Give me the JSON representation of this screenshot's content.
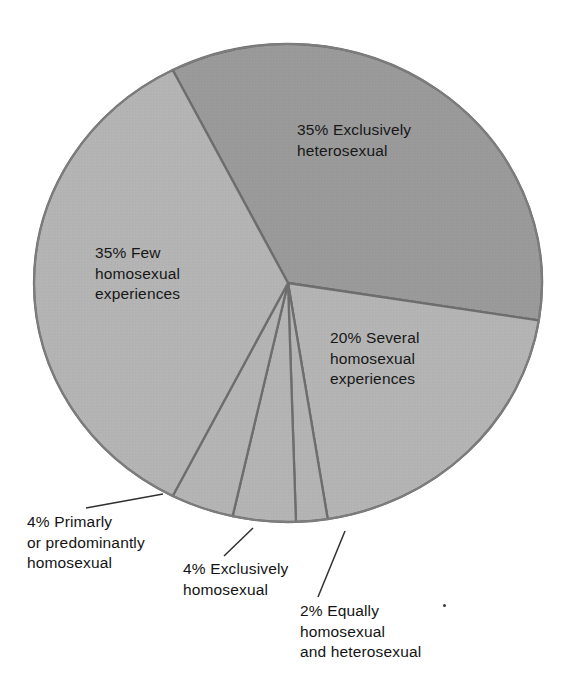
{
  "chart_data": {
    "type": "pie",
    "title": "",
    "subtitle": "",
    "xlabel": "",
    "ylabel": "",
    "legend_position": "none",
    "grid": false,
    "units": "percent",
    "total": 100,
    "center": {
      "x": 288,
      "y": 283
    },
    "radius": {
      "x": 254,
      "y": 239
    },
    "start_angle_deg": -27,
    "direction": "clockwise",
    "colors": {
      "highlight_slice": "#9a9a9a",
      "base_slice": "#b4b4b4",
      "separator": "#6d6d6d",
      "outline": "#7d7d7d",
      "leader_line": "#2e2e2e",
      "text": "#191919",
      "background": "#ffffff"
    },
    "categories": [
      "Exclusively heterosexual",
      "Several homosexual experiences",
      "Equally homosexual and heterosexual",
      "Exclusively homosexual",
      "Primarly or predominantly homosexual",
      "Few homosexual experiences"
    ],
    "values": [
      35,
      20,
      2,
      4,
      4,
      35
    ],
    "slices": [
      {
        "id": "exclusively-heterosexual",
        "percent": 35,
        "percent_text": "35%",
        "label": "Exclusively heterosexual",
        "full_text": "35% Exclusively\nheterosexual",
        "color": "#9a9a9a",
        "label_placement": "inside",
        "has_leader_line": false
      },
      {
        "id": "several-homosexual-experiences",
        "percent": 20,
        "percent_text": "20%",
        "label": "Several homosexual experiences",
        "full_text": "20% Several\nhomosexual\nexperiences",
        "color": "#b4b4b4",
        "label_placement": "inside",
        "has_leader_line": false
      },
      {
        "id": "equally-homosexual-and-heterosexual",
        "percent": 2,
        "percent_text": "2%",
        "label": "Equally homosexual and heterosexual",
        "full_text": "2% Equally\nhomosexual\nand heterosexual",
        "color": "#b4b4b4",
        "label_placement": "outside",
        "has_leader_line": true
      },
      {
        "id": "exclusively-homosexual",
        "percent": 4,
        "percent_text": "4%",
        "label": "Exclusively homosexual",
        "full_text": "4% Exclusively\nhomosexual",
        "color": "#b4b4b4",
        "label_placement": "outside",
        "has_leader_line": true
      },
      {
        "id": "primarly-or-predominantly-homosexual",
        "percent": 4,
        "percent_text": "4%",
        "label": "Primarly or predominantly homosexual",
        "full_text": "4% Primarly\nor predominantly\nhomosexual",
        "color": "#b4b4b4",
        "label_placement": "outside",
        "has_leader_line": true
      },
      {
        "id": "few-homosexual-experiences",
        "percent": 35,
        "percent_text": "35%",
        "label": "Few homosexual experiences",
        "full_text": "35% Few\nhomosexual\nexperiences",
        "color": "#b4b4b4",
        "label_placement": "inside",
        "has_leader_line": false
      }
    ]
  },
  "labels": {
    "heterosexual": "35% Exclusively\nheterosexual",
    "few": "35% Few\nhomosexual\nexperiences",
    "several": "20% Several\nhomosexual\nexperiences",
    "primarly": "4% Primarly\nor predominantly\nhomosexual",
    "exclusively_homosexual": "4% Exclusively\nhomosexual",
    "equally": "2% Equally\nhomosexual\nand heterosexual"
  }
}
